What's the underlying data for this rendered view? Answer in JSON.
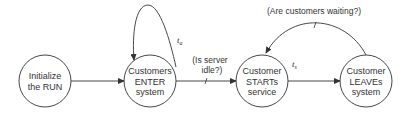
{
  "diagram": {
    "type": "event-graph",
    "colors": {
      "stroke": "#333333",
      "background": "#ffffff",
      "text": "#333333"
    },
    "nodes": [
      {
        "id": "init",
        "lines": [
          "Initialize",
          "the RUN"
        ]
      },
      {
        "id": "enter",
        "lines": [
          "Customers",
          "ENTER",
          "system"
        ]
      },
      {
        "id": "start",
        "lines": [
          "Customer",
          "STARTs",
          "service"
        ]
      },
      {
        "id": "leave",
        "lines": [
          "Customer",
          "LEAVEs",
          "system"
        ]
      }
    ],
    "edges": [
      {
        "from": "init",
        "to": "enter",
        "delay": "",
        "condition": ""
      },
      {
        "from": "enter",
        "to": "enter",
        "delay": {
          "symbol": "t",
          "sub": "a"
        },
        "condition": ""
      },
      {
        "from": "enter",
        "to": "start",
        "delay": "",
        "condition_lines": [
          "(Is server",
          "idle?)"
        ]
      },
      {
        "from": "start",
        "to": "leave",
        "delay": {
          "symbol": "t",
          "sub": "s"
        },
        "condition": ""
      },
      {
        "from": "leave",
        "to": "start",
        "delay": "",
        "condition": "(Are customers waiting?)"
      }
    ]
  }
}
